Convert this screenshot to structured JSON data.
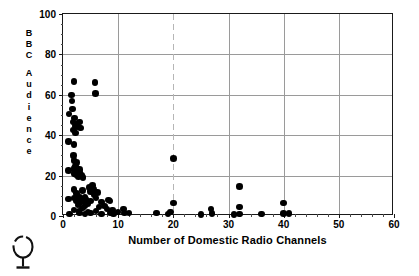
{
  "chart_data": {
    "type": "scatter",
    "title": "",
    "xlabel": "Number of Domestic Radio Channels",
    "ylabel": "BBC Audience",
    "ylabel_letters": [
      "B",
      "B",
      "C",
      "",
      "A",
      "u",
      "d",
      "i",
      "e",
      "n",
      "c",
      "e"
    ],
    "xlim": [
      0,
      60
    ],
    "ylim": [
      0,
      100
    ],
    "xticks": [
      0,
      10,
      20,
      30,
      40,
      50,
      60
    ],
    "yticks": [
      0,
      20,
      40,
      60,
      80,
      100
    ],
    "xtick_labels": [
      "0",
      "10",
      "20",
      "30",
      "40",
      "50",
      "60"
    ],
    "ytick_labels": [
      "0",
      "20",
      "40",
      "60",
      "80",
      "100"
    ],
    "x_minor_step": 2,
    "y_minor_step": 5,
    "grid": true,
    "grid_color": "#9a9a9a",
    "legend": null,
    "marker": "filled-circle",
    "marker_color": "#000000",
    "marker_size": 6.6,
    "points": [
      [
        1.0,
        37.0
      ],
      [
        1.0,
        22.5
      ],
      [
        1.0,
        8.5
      ],
      [
        1.1,
        50.5
      ],
      [
        1.2,
        1.0
      ],
      [
        1.5,
        60.0
      ],
      [
        1.6,
        57.0
      ],
      [
        1.7,
        53.0
      ],
      [
        1.8,
        46.5
      ],
      [
        1.9,
        42.5
      ],
      [
        1.9,
        30.0
      ],
      [
        2.0,
        66.5
      ],
      [
        2.0,
        35.5
      ],
      [
        2.0,
        27.5
      ],
      [
        2.0,
        23.5
      ],
      [
        2.0,
        21.0
      ],
      [
        2.0,
        13.0
      ],
      [
        2.0,
        9.0
      ],
      [
        2.0,
        3.0
      ],
      [
        2.1,
        48.5
      ],
      [
        2.2,
        44.5
      ],
      [
        2.3,
        41.0
      ],
      [
        2.3,
        24.5
      ],
      [
        2.4,
        20.5
      ],
      [
        2.5,
        45.5
      ],
      [
        2.5,
        26.5
      ],
      [
        2.5,
        11.0
      ],
      [
        2.5,
        7.5
      ],
      [
        2.6,
        22.0
      ],
      [
        2.7,
        5.5
      ],
      [
        2.8,
        44.0
      ],
      [
        2.8,
        19.5
      ],
      [
        2.9,
        2.5
      ],
      [
        3.0,
        46.5
      ],
      [
        3.0,
        23.0
      ],
      [
        3.0,
        21.5
      ],
      [
        3.0,
        9.5
      ],
      [
        3.0,
        6.5
      ],
      [
        3.0,
        1.5
      ],
      [
        3.2,
        43.5
      ],
      [
        3.3,
        20.0
      ],
      [
        3.4,
        8.0
      ],
      [
        3.5,
        12.5
      ],
      [
        3.5,
        4.0
      ],
      [
        3.6,
        19.0
      ],
      [
        3.8,
        7.0
      ],
      [
        4.0,
        9.5
      ],
      [
        4.0,
        5.0
      ],
      [
        4.0,
        1.0
      ],
      [
        4.2,
        8.5
      ],
      [
        4.5,
        6.0
      ],
      [
        4.5,
        2.0
      ],
      [
        4.8,
        14.0
      ],
      [
        5.0,
        12.0
      ],
      [
        5.0,
        7.5
      ],
      [
        5.0,
        1.5
      ],
      [
        5.3,
        15.0
      ],
      [
        5.5,
        13.0
      ],
      [
        5.6,
        10.5
      ],
      [
        5.8,
        66.0
      ],
      [
        5.9,
        60.5
      ],
      [
        6.0,
        9.0
      ],
      [
        6.0,
        2.5
      ],
      [
        6.3,
        11.5
      ],
      [
        6.5,
        4.5
      ],
      [
        7.0,
        7.0
      ],
      [
        7.0,
        1.0
      ],
      [
        7.5,
        5.0
      ],
      [
        8.0,
        3.5
      ],
      [
        8.3,
        8.0
      ],
      [
        8.5,
        7.5
      ],
      [
        8.6,
        1.5
      ],
      [
        9.0,
        3.0
      ],
      [
        9.2,
        1.0
      ],
      [
        10.0,
        2.0
      ],
      [
        11.0,
        3.5
      ],
      [
        11.2,
        1.5
      ],
      [
        12.0,
        1.5
      ],
      [
        17.0,
        1.5
      ],
      [
        19.0,
        1.0
      ],
      [
        19.5,
        2.0
      ],
      [
        20.0,
        28.5
      ],
      [
        20.0,
        6.5
      ],
      [
        25.0,
        0.8
      ],
      [
        26.8,
        3.5
      ],
      [
        27.0,
        1.2
      ],
      [
        31.0,
        0.8
      ],
      [
        32.0,
        14.5
      ],
      [
        32.0,
        4.5
      ],
      [
        32.0,
        1.0
      ],
      [
        36.0,
        1.0
      ],
      [
        40.0,
        6.5
      ],
      [
        40.0,
        1.2
      ],
      [
        41.0,
        1.2
      ]
    ]
  },
  "figure": {
    "background_color": "#ffffff",
    "axis_color": "#1a1a1a",
    "frame": true
  },
  "artifact": {
    "name": "scan-artifact-balloon-mark",
    "description": "balloon-shaped ink mark"
  }
}
